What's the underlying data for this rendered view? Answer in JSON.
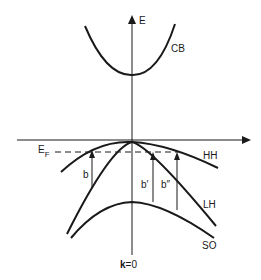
{
  "diagram": {
    "type": "band-structure",
    "axis_labels": {
      "energy": "E",
      "k_origin_bold": "k",
      "k_origin_rest": "=0"
    },
    "bands": [
      {
        "id": "CB",
        "label": "CB"
      },
      {
        "id": "HH",
        "label": "HH"
      },
      {
        "id": "LH",
        "label": "LH"
      },
      {
        "id": "SO",
        "label": "SO"
      }
    ],
    "fermi_level": {
      "label_main": "E",
      "label_sub": "F"
    },
    "transitions": [
      {
        "id": "b",
        "label": "b"
      },
      {
        "id": "b-prime",
        "label": "b′"
      },
      {
        "id": "b-double-prime",
        "label": "b″"
      }
    ],
    "colors": {
      "line": "#1a1a1a",
      "background": "#ffffff"
    }
  }
}
